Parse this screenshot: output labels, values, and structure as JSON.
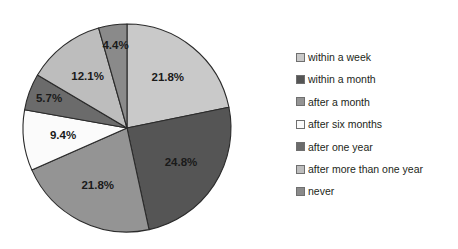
{
  "chart_data": {
    "type": "pie",
    "title": "",
    "categories": [
      "within a week",
      "within a month",
      "after a month",
      "after six months",
      "after one year",
      "after more than one year",
      "never"
    ],
    "values": [
      21.8,
      24.8,
      21.8,
      9.4,
      5.7,
      12.1,
      4.4
    ],
    "value_labels": [
      "21.8%",
      "24.8%",
      "21.8%",
      "9.4%",
      "5.7%",
      "12.1%",
      "4.4%"
    ],
    "colors": [
      "#c9c9c9",
      "#555555",
      "#949494",
      "#fbfbfb",
      "#6b6b6b",
      "#bdbdbd",
      "#8a8a8a"
    ],
    "units": "percent",
    "start_angle_deg": 0,
    "direction": "clockwise",
    "legend_position": "right",
    "grid": false,
    "xlabel": "",
    "ylabel": ""
  },
  "legend": {
    "items": [
      {
        "label": "within a week",
        "color": "#c9c9c9"
      },
      {
        "label": "within a month",
        "color": "#555555"
      },
      {
        "label": "after a month",
        "color": "#949494"
      },
      {
        "label": "after six months",
        "color": "#fbfbfb"
      },
      {
        "label": "after one year",
        "color": "#6b6b6b"
      },
      {
        "label": "after more than one year",
        "color": "#bdbdbd"
      },
      {
        "label": "never",
        "color": "#8a8a8a"
      }
    ]
  },
  "pie": {
    "center_x": 127,
    "center_y": 128,
    "radius": 104,
    "outline_color": "#2b2b2b"
  }
}
